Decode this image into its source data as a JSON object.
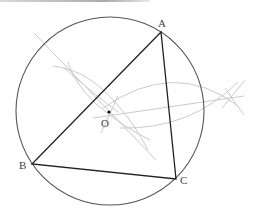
{
  "diagram": {
    "labels": {
      "A": "A",
      "B": "B",
      "C": "C",
      "O": "O"
    },
    "points": {
      "A": {
        "x": 161,
        "y": 32
      },
      "B": {
        "x": 32,
        "y": 164
      },
      "C": {
        "x": 176,
        "y": 179
      },
      "O": {
        "x": 109,
        "y": 112
      }
    },
    "circle": {
      "cx": 110,
      "cy": 111,
      "r": 94
    },
    "colors": {
      "triangle": "#222222",
      "circle": "#555555",
      "construction": "#bbbbbb",
      "label": "#444444"
    }
  }
}
